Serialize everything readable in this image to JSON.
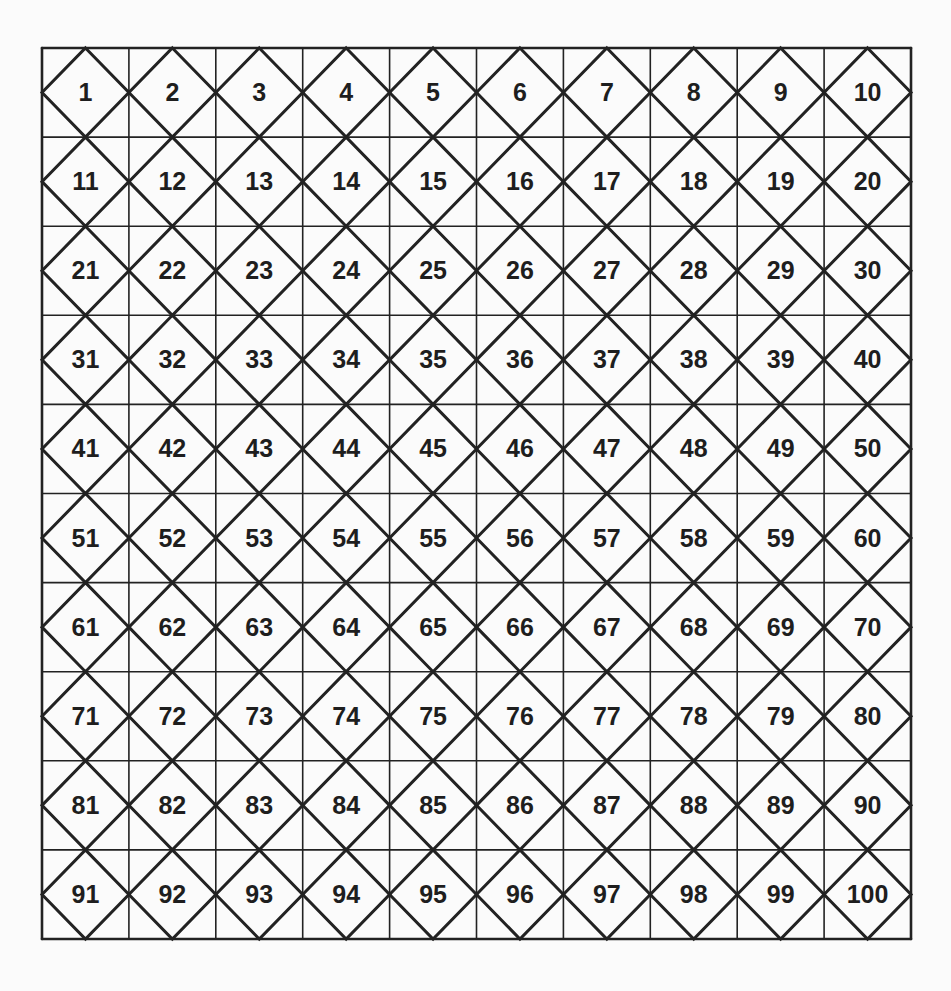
{
  "diagram": {
    "type": "hundreds-chart-diamond-grid",
    "rows": 10,
    "cols": 10,
    "line_color": "#222222",
    "background": "#fbfbfb",
    "numbers": [
      [
        1,
        2,
        3,
        4,
        5,
        6,
        7,
        8,
        9,
        10
      ],
      [
        11,
        12,
        13,
        14,
        15,
        16,
        17,
        18,
        19,
        20
      ],
      [
        21,
        22,
        23,
        24,
        25,
        26,
        27,
        28,
        29,
        30
      ],
      [
        31,
        32,
        33,
        34,
        35,
        36,
        37,
        38,
        39,
        40
      ],
      [
        41,
        42,
        43,
        44,
        45,
        46,
        47,
        48,
        49,
        50
      ],
      [
        51,
        52,
        53,
        54,
        55,
        56,
        57,
        58,
        59,
        60
      ],
      [
        61,
        62,
        63,
        64,
        65,
        66,
        67,
        68,
        69,
        70
      ],
      [
        71,
        72,
        73,
        74,
        75,
        76,
        77,
        78,
        79,
        80
      ],
      [
        81,
        82,
        83,
        84,
        85,
        86,
        87,
        88,
        89,
        90
      ],
      [
        91,
        92,
        93,
        94,
        95,
        96,
        97,
        98,
        99,
        100
      ]
    ]
  }
}
